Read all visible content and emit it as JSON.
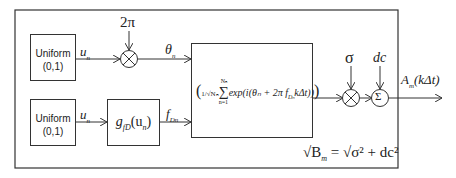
{
  "blocks": {
    "uniform_top": {
      "line1": "Uniform",
      "line2": "(0,1)"
    },
    "uniform_bottom": {
      "line1": "Uniform",
      "line2": "(0,1)"
    },
    "mapping": {
      "func": "g",
      "sub": "fD",
      "arg": "(u",
      "arg_sub": "n",
      "close": ")"
    },
    "sum_block": {
      "prefix": "1/√Nₙ",
      "sum": "∑",
      "upper": "Nₙ",
      "lower": "n=1",
      "body": "exp(i(θₙ + 2π f",
      "body_sub": "Dₙ",
      "body_end": "kΔt))"
    }
  },
  "signals": {
    "u_top": "u",
    "u_top_sub": "n",
    "u_bottom": "u",
    "u_bottom_sub": "n",
    "two_pi": "2π",
    "theta": "θ",
    "theta_sub": "n",
    "fD": "f",
    "fD_sub": "Dn",
    "sigma": "σ",
    "dc": "dc",
    "output": "A",
    "output_sub": "m",
    "output_arg": "(kΔt)"
  },
  "operators": {
    "multiply": "⊗",
    "sum": "Σ"
  },
  "equation": {
    "lhs": "√B",
    "lhs_sub": "m",
    "eq": " = √σ² + dc²"
  }
}
